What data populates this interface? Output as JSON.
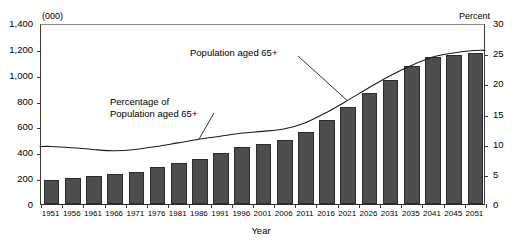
{
  "axes": {
    "left_unit_label": "(000)",
    "right_unit_label": "Percent",
    "x_title": "Year",
    "left_ticks": [
      "0",
      "200",
      "400",
      "600",
      "800",
      "1,000",
      "1,200",
      "1,400"
    ],
    "right_ticks": [
      "0",
      "5",
      "10",
      "15",
      "20",
      "25",
      "30"
    ]
  },
  "annotations": {
    "population_label": "Population aged 65+",
    "percentage_label_line1": "Percentage of",
    "percentage_label_line2": "Population aged 65+"
  },
  "chart_data": {
    "type": "bar",
    "title": "",
    "xlabel": "Year",
    "ylabel": "(000)",
    "y2label": "Percent",
    "ylim": [
      0,
      1400
    ],
    "y2lim": [
      0,
      30
    ],
    "ytick_labels": [
      "0",
      "200",
      "400",
      "600",
      "800",
      "1,000",
      "1,200",
      "1,400"
    ],
    "ytick_values": [
      0,
      200,
      400,
      600,
      800,
      1000,
      1200,
      1400
    ],
    "y2tick_labels": [
      "0",
      "5",
      "10",
      "15",
      "20",
      "25",
      "30"
    ],
    "y2tick_values": [
      0,
      5,
      10,
      15,
      20,
      25,
      30
    ],
    "grid": false,
    "legend_position": "inline-annotations",
    "categories": [
      "1951",
      "1956",
      "1961",
      "1966",
      "1971",
      "1976",
      "1981",
      "1986",
      "1991",
      "1996",
      "2001",
      "2006",
      "2011",
      "2016",
      "2021",
      "2026",
      "2031",
      "2035",
      "2041",
      "2045",
      "2051"
    ],
    "series": [
      {
        "name": "Population aged 65+",
        "type": "bar",
        "axis": "left",
        "unit": "thousands",
        "color": "#4d4d4d",
        "values": [
          185,
          202,
          216,
          231,
          250,
          285,
          318,
          350,
          392,
          440,
          466,
          492,
          560,
          652,
          752,
          856,
          962,
          1068,
          1138,
          1152,
          1168
        ]
      },
      {
        "name": "Percentage of Population aged 65+",
        "type": "line",
        "axis": "right",
        "unit": "percent",
        "color": "#1a1a1a",
        "values": [
          9.7,
          9.5,
          9.2,
          9.0,
          9.2,
          9.7,
          10.3,
          10.9,
          11.4,
          11.9,
          12.2,
          12.6,
          13.6,
          15.3,
          17.3,
          19.4,
          21.4,
          23.1,
          24.5,
          25.2,
          25.6
        ]
      }
    ]
  }
}
